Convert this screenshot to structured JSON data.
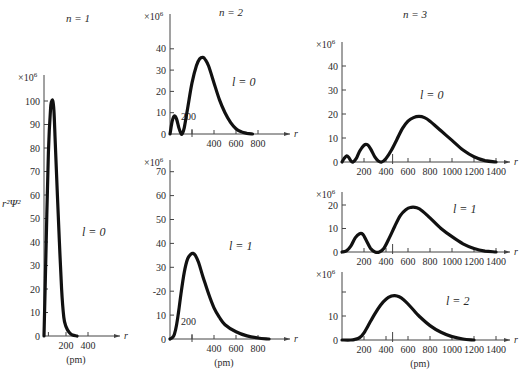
{
  "chart_data": {
    "type": "line",
    "ylabel": "r²Ψ²",
    "xlabel": "r (pm)",
    "y_multiplier": "×10⁶",
    "grid": false,
    "columns": [
      {
        "label": "n = 1"
      },
      {
        "label": "n = 2"
      },
      {
        "label": "n = 3"
      }
    ],
    "panels": [
      {
        "id": "n1-l0",
        "n": 1,
        "l": 0,
        "l_label": "l = 0",
        "box": {
          "x0": 44,
          "y0": 336,
          "px_per_x": 0.11,
          "px_per_y": 2.35
        },
        "x_axis_end": 120,
        "y_axis_top": 75,
        "xticks": [
          {
            "v": 40,
            "label": ""
          },
          {
            "v": 200,
            "label": "200"
          },
          {
            "v": 400,
            "label": "400"
          }
        ],
        "yticks": [
          {
            "v": 0,
            "label": "0"
          },
          {
            "v": 10,
            "label": "10"
          },
          {
            "v": 20,
            "label": "20"
          },
          {
            "v": 30,
            "label": "30"
          },
          {
            "v": 40,
            "label": "40"
          },
          {
            "v": 50,
            "label": "50"
          },
          {
            "v": 60,
            "label": "60"
          },
          {
            "v": 70,
            "label": "70"
          },
          {
            "v": 80,
            "label": "80"
          },
          {
            "v": 90,
            "label": "90"
          },
          {
            "v": 100,
            "label": "100"
          }
        ],
        "show_pm": true,
        "l_label_pos": [
          82,
          236
        ],
        "x": [
          0,
          20,
          40,
          60,
          70,
          80,
          90,
          100,
          120,
          140,
          160,
          180,
          200,
          230,
          260,
          300
        ],
        "y": [
          0,
          40,
          78,
          97,
          100,
          100,
          96,
          85,
          62,
          40,
          20,
          8,
          4,
          1.5,
          0.4,
          0
        ]
      },
      {
        "id": "n2-l0",
        "n": 2,
        "l": 0,
        "l_label": "l = 0",
        "box": {
          "x0": 170,
          "y0": 134,
          "px_per_x": 0.11,
          "px_per_y": 2.13
        },
        "x_axis_end": 290,
        "y_axis_top": 14,
        "xticks": [
          {
            "v": 200,
            "label": "200"
          },
          {
            "v": 400,
            "label": "400"
          },
          {
            "v": 600,
            "label": "600"
          },
          {
            "v": 800,
            "label": "800"
          }
        ],
        "yticks": [
          {
            "v": 0,
            "label": "0"
          },
          {
            "v": 10,
            "label": "10"
          },
          {
            "v": 20,
            "label": "20"
          },
          {
            "v": 30,
            "label": "30"
          },
          {
            "v": 40,
            "label": "40"
          }
        ],
        "inline_200": true,
        "show_pm": false,
        "l_label_pos": [
          232,
          86
        ],
        "x": [
          0,
          20,
          40,
          60,
          80,
          100,
          110,
          130,
          160,
          200,
          240,
          270,
          300,
          320,
          350,
          400,
          450,
          500,
          550,
          600,
          650,
          700,
          750
        ],
        "y": [
          0,
          6,
          8.5,
          7,
          3,
          0.3,
          0,
          3,
          12,
          24,
          32,
          35.3,
          36,
          35,
          32,
          24,
          16,
          10,
          5.5,
          2.5,
          1,
          0.3,
          0
        ]
      },
      {
        "id": "n2-l1",
        "n": 2,
        "l": 1,
        "l_label": "l = 1",
        "box": {
          "x0": 170,
          "y0": 339,
          "px_per_x": 0.11,
          "px_per_y": 2.39
        },
        "x_axis_end": 290,
        "y_axis_top": 160,
        "xticks": [
          {
            "v": 200,
            "label": "200"
          },
          {
            "v": 400,
            "label": "400"
          },
          {
            "v": 600,
            "label": "600"
          },
          {
            "v": 800,
            "label": "800"
          }
        ],
        "yticks": [
          {
            "v": 0,
            "label": "0"
          },
          {
            "v": 10,
            "label": "10"
          },
          {
            "v": 20,
            "label": "-20"
          },
          {
            "v": 30,
            "label": "30"
          },
          {
            "v": 40,
            "label": "40"
          },
          {
            "v": 50,
            "label": "50"
          },
          {
            "v": 60,
            "label": "60"
          },
          {
            "v": 70,
            "label": "70"
          }
        ],
        "inline_200": true,
        "show_pm": true,
        "l_label_pos": [
          229,
          250
        ],
        "x": [
          0,
          20,
          40,
          60,
          80,
          100,
          130,
          160,
          190,
          210,
          230,
          260,
          300,
          350,
          400,
          450,
          500,
          600,
          700,
          800,
          900
        ],
        "y": [
          0,
          0.5,
          2,
          6,
          12,
          19,
          28,
          33.5,
          35.5,
          35.8,
          35,
          32,
          26,
          19,
          13,
          9,
          6,
          3,
          1.3,
          0.4,
          0
        ]
      },
      {
        "id": "n3-l0",
        "n": 3,
        "l": 0,
        "l_label": "l = 0",
        "box": {
          "x0": 342,
          "y0": 162,
          "px_per_x": 0.11,
          "px_per_y": 2.4
        },
        "x_axis_end": 510,
        "y_axis_top": 42,
        "xticks": [
          {
            "v": 200,
            "label": "200"
          },
          {
            "v": 400,
            "label": "400"
          },
          {
            "v": 600,
            "label": "600"
          },
          {
            "v": 800,
            "label": "800"
          },
          {
            "v": 1000,
            "label": "1000"
          },
          {
            "v": 1200,
            "label": "1200"
          },
          {
            "v": 1400,
            "label": "1400"
          }
        ],
        "extra_tick": 460,
        "yticks": [
          {
            "v": 0,
            "label": "0"
          },
          {
            "v": 10,
            "label": "10"
          },
          {
            "v": 20,
            "label": "20"
          },
          {
            "v": 30,
            "label": "30"
          },
          {
            "v": 40,
            "label": "40"
          }
        ],
        "show_pm": false,
        "l_label_pos": [
          420,
          99
        ],
        "x": [
          0,
          20,
          40,
          60,
          80,
          100,
          130,
          160,
          200,
          230,
          260,
          300,
          330,
          360,
          400,
          450,
          500,
          550,
          600,
          650,
          700,
          750,
          800,
          900,
          1000,
          1100,
          1200,
          1300,
          1400
        ],
        "y": [
          0,
          1.5,
          2.5,
          2,
          0.5,
          0,
          1.5,
          4.5,
          7,
          7.2,
          5.5,
          2,
          0.4,
          0,
          1.5,
          5,
          9.5,
          14,
          17,
          18.5,
          19,
          18.5,
          17,
          13,
          9,
          5,
          2.2,
          0.6,
          0
        ]
      },
      {
        "id": "n3-l1",
        "n": 3,
        "l": 1,
        "l_label": "l = 1",
        "box": {
          "x0": 342,
          "y0": 252,
          "px_per_x": 0.11,
          "px_per_y": 2.35
        },
        "x_axis_end": 510,
        "y_axis_top": 192,
        "xticks": [
          {
            "v": 200,
            "label": "200"
          },
          {
            "v": 400,
            "label": "400"
          },
          {
            "v": 600,
            "label": "600"
          },
          {
            "v": 800,
            "label": "800"
          },
          {
            "v": 1000,
            "label": "1000"
          },
          {
            "v": 1200,
            "label": "1200"
          },
          {
            "v": 1400,
            "label": "1400"
          }
        ],
        "extra_tick": 460,
        "yticks": [
          {
            "v": 0,
            "label": "0"
          },
          {
            "v": 10,
            "label": "10"
          },
          {
            "v": 20,
            "label": "20"
          }
        ],
        "show_pm": false,
        "l_label_pos": [
          453,
          213
        ],
        "x": [
          0,
          40,
          80,
          120,
          160,
          190,
          220,
          260,
          300,
          340,
          380,
          430,
          480,
          530,
          580,
          630,
          680,
          730,
          800,
          900,
          1000,
          1100,
          1200,
          1300,
          1400
        ],
        "y": [
          0,
          0.5,
          2.5,
          6,
          7.8,
          7.5,
          5,
          1.5,
          0,
          0,
          1.5,
          6,
          11,
          15.5,
          18,
          19,
          18.8,
          17.5,
          14.5,
          10,
          6.5,
          3.5,
          1.5,
          0.4,
          0
        ]
      },
      {
        "id": "n3-l2",
        "n": 3,
        "l": 2,
        "l_label": "l = 2",
        "box": {
          "x0": 342,
          "y0": 340,
          "px_per_x": 0.11,
          "px_per_y": 2.4
        },
        "x_axis_end": 510,
        "y_axis_top": 272,
        "xticks": [
          {
            "v": 200,
            "label": "200"
          },
          {
            "v": 400,
            "label": "400"
          },
          {
            "v": 600,
            "label": "600"
          },
          {
            "v": 800,
            "label": "800"
          },
          {
            "v": 1000,
            "label": "1000"
          },
          {
            "v": 1200,
            "label": "1200"
          },
          {
            "v": 1400,
            "label": "1400"
          }
        ],
        "extra_tick": 460,
        "yticks": [
          {
            "v": 0,
            "label": "0"
          },
          {
            "v": 10,
            "label": "10"
          },
          {
            "v": 20,
            "label": ""
          }
        ],
        "show_pm": true,
        "l_label_pos": [
          446,
          305
        ],
        "x": [
          0,
          80,
          120,
          160,
          200,
          250,
          300,
          350,
          400,
          450,
          480,
          520,
          560,
          600,
          650,
          700,
          800,
          900,
          1000,
          1100,
          1200
        ],
        "y": [
          0,
          0,
          0.3,
          1,
          3,
          7,
          11,
          14.5,
          17,
          18.3,
          18.5,
          18,
          16.8,
          15,
          12.5,
          10,
          6,
          3.2,
          1.4,
          0.4,
          0
        ]
      }
    ]
  },
  "labels": {
    "ylabel": "r²Ψ²",
    "multiplier": "×10",
    "multiplier_exp": "6",
    "axis_var": "r",
    "unit": "(pm)",
    "n1": "n = 1",
    "n2": "n = 2",
    "n3": "n = 3",
    "inline_200": "200"
  }
}
